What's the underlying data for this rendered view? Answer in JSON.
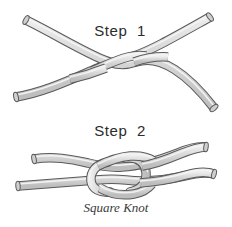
{
  "figure": {
    "title": "Square Knot",
    "background_color": "#ffffff",
    "width": 232,
    "height": 227
  },
  "steps": [
    {
      "label": "Step  1",
      "name": "step-1"
    },
    {
      "label": "Step  2",
      "name": "step-2"
    }
  ],
  "caption": "Square Knot",
  "rope": {
    "fill_color": "#d4d4d4",
    "highlight_color": "#efefef",
    "outline_color": "#5a5a5a",
    "outline_width": 1
  },
  "illustration": {
    "step1_description": "Two ropes crossed with a single overhand twist at the center",
    "step2_description": "Completed square knot with two interlocking bights",
    "rope_count": 2
  }
}
